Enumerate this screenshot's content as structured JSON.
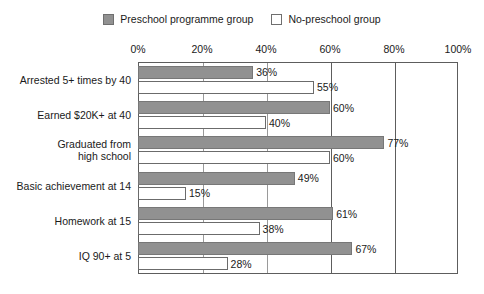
{
  "legend": {
    "entries": [
      {
        "label": "Preschool programme group",
        "swatch": "filled-square-icon",
        "color": "#919191"
      },
      {
        "label": "No-preschool group",
        "swatch": "empty-square-icon",
        "color": "#ffffff"
      }
    ]
  },
  "chart_data": {
    "type": "bar",
    "orientation": "horizontal",
    "title": "",
    "xlabel": "",
    "ylabel": "",
    "xlim": [
      0,
      100
    ],
    "xticks": [
      0,
      20,
      40,
      60,
      80,
      100
    ],
    "xtick_labels": [
      "0%",
      "20%",
      "40%",
      "60%",
      "80%",
      "100%"
    ],
    "grid": true,
    "legend_position": "top-center",
    "categories": [
      "Arrested 5+ times by 40",
      "Earned $20K+ at 40",
      "Graduated from\nhigh school",
      "Basic achievement at 14",
      "Homework at 15",
      "IQ 90+ at 5"
    ],
    "series": [
      {
        "name": "Preschool programme group",
        "color": "#919191",
        "values": [
          36,
          60,
          77,
          49,
          61,
          67
        ],
        "value_labels": [
          "36%",
          "60%",
          "77%",
          "49%",
          "61%",
          "67%"
        ]
      },
      {
        "name": "No-preschool group",
        "color": "#ffffff",
        "values": [
          55,
          40,
          60,
          15,
          38,
          28
        ],
        "value_labels": [
          "55%",
          "40%",
          "60%",
          "15%",
          "38%",
          "28%"
        ]
      }
    ]
  }
}
